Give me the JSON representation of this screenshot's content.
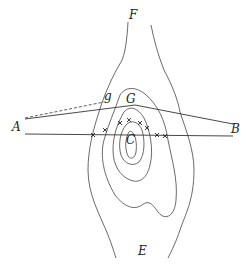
{
  "labels": {
    "F": "F",
    "g": "g",
    "G": "G",
    "A": "A",
    "B": "B",
    "C": "C",
    "E": "E"
  },
  "colors": {
    "ink": "#333333",
    "background": "#ffffff"
  }
}
